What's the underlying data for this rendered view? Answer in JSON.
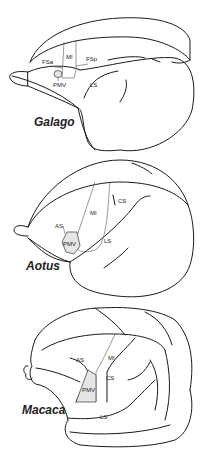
{
  "panels": [
    {
      "species": "Galago",
      "labels": {
        "fsa": "FSa",
        "mi": "MI",
        "fsp": "FSp",
        "pmv": "PMV",
        "ls": "LS"
      }
    },
    {
      "species": "Aotus",
      "labels": {
        "as": "AS",
        "mi": "MI",
        "cs": "CS",
        "pmv": "PMV",
        "ls": "LS"
      }
    },
    {
      "species": "Macaca",
      "labels": {
        "as": "AS",
        "mi": "MI",
        "cs": "CS",
        "pmv": "PMV",
        "ls": "LS"
      }
    }
  ],
  "colors": {
    "line": "#1a1a1a",
    "pmv_fill": "#e6e6e6"
  }
}
